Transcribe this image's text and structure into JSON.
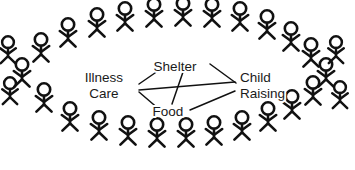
{
  "diagram": {
    "background_color": "#ffffff",
    "stroke_color": "#111111",
    "text_color": "#1a1a1a",
    "nodes": [
      {
        "id": "illness-care",
        "lines": [
          "Illness",
          "Care"
        ],
        "line1": "Illness",
        "line2": "Care",
        "x": 104,
        "y": 86,
        "anchor": "middle"
      },
      {
        "id": "shelter",
        "lines": [
          "Shelter"
        ],
        "line1": "Shelter",
        "x": 175,
        "y": 67,
        "anchor": "middle"
      },
      {
        "id": "food",
        "lines": [
          "Food"
        ],
        "line1": "Food",
        "x": 168,
        "y": 112,
        "anchor": "middle"
      },
      {
        "id": "child-raising",
        "lines": [
          "Child",
          "Raising"
        ],
        "line1": "Child",
        "line2": "Raising",
        "x": 240,
        "y": 86,
        "anchor": "start"
      }
    ],
    "edges": [
      {
        "from": "illness-care",
        "to": "shelter",
        "x1": 139,
        "y1": 84,
        "x2": 168,
        "y2": 64
      },
      {
        "from": "illness-care",
        "to": "child-raising",
        "x1": 139,
        "y1": 90,
        "x2": 235,
        "y2": 82
      },
      {
        "from": "illness-care",
        "to": "food",
        "x1": 139,
        "y1": 92,
        "x2": 160,
        "y2": 110
      },
      {
        "from": "shelter",
        "to": "child-raising",
        "x1": 210,
        "y1": 64,
        "x2": 236,
        "y2": 83
      },
      {
        "from": "shelter",
        "to": "food",
        "x1": 183,
        "y1": 72,
        "x2": 172,
        "y2": 104
      },
      {
        "from": "food",
        "to": "child-raising",
        "x1": 190,
        "y1": 110,
        "x2": 235,
        "y2": 91
      }
    ],
    "crowd": {
      "description": "ring of stick figures surrounding the network",
      "figure_count": 28,
      "figures": [
        {
          "x": 22,
          "y": 78,
          "s": 1.0
        },
        {
          "x": 41,
          "y": 53,
          "s": 1.0
        },
        {
          "x": 44,
          "y": 103,
          "s": 1.0
        },
        {
          "x": 68,
          "y": 38,
          "s": 1.0
        },
        {
          "x": 70,
          "y": 122,
          "s": 1.0
        },
        {
          "x": 97,
          "y": 28,
          "s": 1.0
        },
        {
          "x": 99,
          "y": 131,
          "s": 1.0
        },
        {
          "x": 125,
          "y": 22,
          "s": 1.0
        },
        {
          "x": 128,
          "y": 136,
          "s": 1.0
        },
        {
          "x": 154,
          "y": 18,
          "s": 1.0
        },
        {
          "x": 157,
          "y": 138,
          "s": 1.0
        },
        {
          "x": 183,
          "y": 17,
          "s": 1.0
        },
        {
          "x": 186,
          "y": 138,
          "s": 1.0
        },
        {
          "x": 212,
          "y": 18,
          "s": 1.0
        },
        {
          "x": 214,
          "y": 136,
          "s": 1.0
        },
        {
          "x": 240,
          "y": 22,
          "s": 1.0
        },
        {
          "x": 242,
          "y": 131,
          "s": 1.0
        },
        {
          "x": 267,
          "y": 30,
          "s": 1.0
        },
        {
          "x": 268,
          "y": 122,
          "s": 1.0
        },
        {
          "x": 291,
          "y": 42,
          "s": 1.0
        },
        {
          "x": 292,
          "y": 110,
          "s": 1.0
        },
        {
          "x": 311,
          "y": 58,
          "s": 1.0
        },
        {
          "x": 313,
          "y": 96,
          "s": 1.0
        },
        {
          "x": 326,
          "y": 78,
          "s": 1.0
        },
        {
          "x": 10,
          "y": 96,
          "s": 0.95
        },
        {
          "x": 336,
          "y": 55,
          "s": 0.95
        },
        {
          "x": 340,
          "y": 100,
          "s": 0.95
        },
        {
          "x": 8,
          "y": 55,
          "s": 0.95
        }
      ]
    }
  }
}
